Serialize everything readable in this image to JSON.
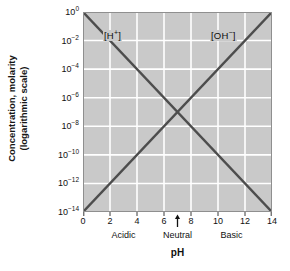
{
  "chart_data": {
    "type": "line",
    "title": "",
    "xlabel": "pH",
    "ylabel_line1": "Concentration, molarity",
    "ylabel_line2": "(logarithmic scale)",
    "xlim": [
      0,
      14
    ],
    "ylim_exponents": [
      -14,
      0
    ],
    "yscale": "log",
    "grid": true,
    "legend_position": "inline-annotation",
    "x_ticks": [
      {
        "value": 0,
        "label": "0"
      },
      {
        "value": 2,
        "label": "2"
      },
      {
        "value": 4,
        "label": "4"
      },
      {
        "value": 6,
        "label": "6"
      },
      {
        "value": 8,
        "label": "8"
      },
      {
        "value": 10,
        "label": "10"
      },
      {
        "value": 12,
        "label": "12"
      },
      {
        "value": 14,
        "label": "14"
      }
    ],
    "y_ticks": [
      {
        "exponent": 0,
        "base": "10",
        "exp_label": "0",
        "label": "10^0"
      },
      {
        "exponent": -2,
        "base": "10",
        "exp_label": "-2",
        "label": "10^-2"
      },
      {
        "exponent": -4,
        "base": "10",
        "exp_label": "-4",
        "label": "10^-4"
      },
      {
        "exponent": -6,
        "base": "10",
        "exp_label": "-6",
        "label": "10^-6"
      },
      {
        "exponent": -8,
        "base": "10",
        "exp_label": "-8",
        "label": "10^-8"
      },
      {
        "exponent": -10,
        "base": "10",
        "exp_label": "-10",
        "label": "10^-10"
      },
      {
        "exponent": -12,
        "base": "10",
        "exp_label": "-12",
        "label": "10^-12"
      },
      {
        "exponent": -14,
        "base": "10",
        "exp_label": "-14",
        "label": "10^-14"
      }
    ],
    "series": [
      {
        "name": "[H+]",
        "label_base": "[H",
        "label_sup": "+",
        "label_tail": "]",
        "color": "#4d4d4d",
        "x": [
          0,
          14
        ],
        "y_exponents": [
          0,
          -14
        ]
      },
      {
        "name": "[OH-]",
        "label_base": "[OH",
        "label_sup": "−",
        "label_tail": "]",
        "color": "#4d4d4d",
        "x": [
          0,
          14
        ],
        "y_exponents": [
          -14,
          0
        ]
      }
    ],
    "regions": [
      {
        "label": "Acidic",
        "center_x": 3
      },
      {
        "label": "Neutral",
        "center_x": 7
      },
      {
        "label": "Basic",
        "center_x": 11
      }
    ],
    "annotations": [
      {
        "name": "neutral-arrow",
        "icon": "up-arrow-icon",
        "x": 7,
        "points_to": "pH 7"
      }
    ],
    "intersection": {
      "x": 7,
      "y_exponent": -7
    },
    "colors": {
      "plot_background": "#c9c9c9",
      "gridline": "#ffffff",
      "axis_text": "#111111",
      "series_line": "#4d4d4d"
    }
  }
}
